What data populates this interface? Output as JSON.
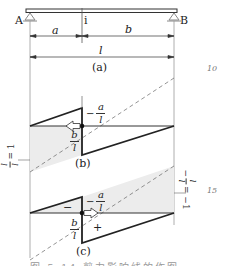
{
  "figure": {
    "beam": {
      "support_left": "A",
      "support_right": "B",
      "section": "i"
    },
    "dimensions": {
      "left_segment": "a",
      "right_segment": "b",
      "total_span": "l"
    },
    "panels": [
      {
        "label": "(a)",
        "description": "simply supported beam with section i"
      },
      {
        "label": "(b)",
        "left_ordinate": "−a/l",
        "left_ordinate_num": "a",
        "left_ordinate_den": "l",
        "left_ordinate_sign": "−",
        "right_ordinate_num": "b",
        "right_ordinate_den": "l",
        "side_annotation_num": "l",
        "side_annotation_den": "l",
        "side_annotation_eq": "= 1",
        "arrow_direction": "left"
      },
      {
        "label": "(c)",
        "left_ordinate_sign": "−",
        "left_ordinate_num": "a",
        "left_ordinate_den": "l",
        "right_ordinate_num": "b",
        "right_ordinate_den": "l",
        "negative_region_sign": "−",
        "positive_region_sign": "+",
        "side_annotation_sign": "−",
        "side_annotation_num": "l",
        "side_annotation_den": "l",
        "side_annotation_eq": "= −1",
        "arrow_direction": "right"
      }
    ],
    "page_margin_numbers": [
      "10",
      "15"
    ],
    "caption": "图 5-14  剪力影响线的作图"
  },
  "colors": {
    "line": "#222222",
    "dashed": "#555555",
    "shade": "#e9e9e9",
    "support": "#888888"
  }
}
